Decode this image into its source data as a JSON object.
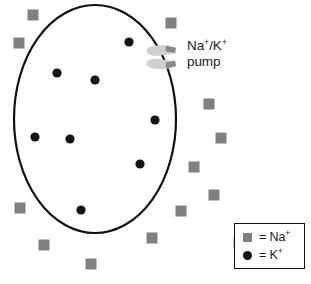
{
  "figure": {
    "background_color": "#ffffff"
  },
  "cell": {
    "name": "cell-membrane-ellipse",
    "shape": "ellipse",
    "cx": 95,
    "cy": 119,
    "rx": 81,
    "ry": 114,
    "stroke_color": "#111111",
    "stroke_width": 2.2,
    "fill_color": "#ffffff"
  },
  "pump": {
    "label_line1": "Na+/K+",
    "label_line1_base": "Na",
    "label_line1_sup1": "+",
    "label_line1_mid": "/K",
    "label_line1_sup2": "+",
    "label_line2": "pump",
    "body_color": "#cfcfcf",
    "accent_color": "#8a8a8a",
    "cx": 162,
    "cy": 57
  },
  "legend": {
    "name": "ion-legend",
    "border_color": "#111111",
    "rows": [
      {
        "marker": "square",
        "marker_color": "#808080",
        "equals": "=",
        "label_base": "Na",
        "label_sup": "+",
        "label_full": "= Na+"
      },
      {
        "marker": "circle",
        "marker_color": "#151515",
        "equals": "=",
        "label_base": "K",
        "label_sup": "+",
        "label_full": "= K+"
      }
    ]
  },
  "ions": {
    "potassium": {
      "species": "K+",
      "marker": "circle",
      "color": "#151515",
      "radius": 4.6,
      "location": "inside-cell",
      "count": 8,
      "points": [
        {
          "x": 57,
          "y": 73
        },
        {
          "x": 95,
          "y": 80
        },
        {
          "x": 155,
          "y": 120
        },
        {
          "x": 35,
          "y": 137
        },
        {
          "x": 70,
          "y": 139
        },
        {
          "x": 140,
          "y": 164
        },
        {
          "x": 81,
          "y": 210
        },
        {
          "x": 129,
          "y": 42
        }
      ]
    },
    "sodium": {
      "species": "Na+",
      "marker": "square",
      "color": "#808080",
      "size": 11,
      "location": "outside-cell",
      "count": 13,
      "points": [
        {
          "x": 33,
          "y": 15
        },
        {
          "x": 19,
          "y": 43
        },
        {
          "x": 171,
          "y": 23
        },
        {
          "x": 209,
          "y": 104
        },
        {
          "x": 221,
          "y": 138
        },
        {
          "x": 194,
          "y": 167
        },
        {
          "x": 214,
          "y": 195
        },
        {
          "x": 181,
          "y": 211
        },
        {
          "x": 152,
          "y": 238
        },
        {
          "x": 91,
          "y": 264
        },
        {
          "x": 44,
          "y": 245
        },
        {
          "x": 20,
          "y": 208
        },
        {
          "x": 239,
          "y": 243
        }
      ]
    }
  }
}
